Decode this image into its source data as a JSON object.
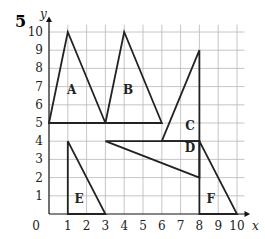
{
  "question_number": "5",
  "axes": {
    "x_label": "x",
    "y_label": "y",
    "x_ticks": [
      "1",
      "2",
      "3",
      "4",
      "5",
      "6",
      "7",
      "8",
      "9",
      "10"
    ],
    "y_ticks": [
      "1",
      "2",
      "3",
      "4",
      "5",
      "6",
      "7",
      "8",
      "9",
      "10"
    ],
    "origin_label": "0",
    "x_range": [
      0,
      10
    ],
    "y_range": [
      0,
      10
    ]
  },
  "shapes": [
    {
      "label": "A",
      "points": [
        [
          0,
          5
        ],
        [
          1,
          10
        ],
        [
          3,
          5
        ]
      ],
      "label_pos": [
        1.2,
        6.6
      ]
    },
    {
      "label": "B",
      "points": [
        [
          3,
          5
        ],
        [
          4,
          10
        ],
        [
          6,
          5
        ]
      ],
      "label_pos": [
        4.2,
        6.6
      ]
    },
    {
      "label": "C",
      "points": [
        [
          6,
          4
        ],
        [
          8,
          9
        ],
        [
          8,
          4
        ]
      ],
      "label_pos": [
        7.5,
        4.6
      ]
    },
    {
      "label": "D",
      "points": [
        [
          3,
          4
        ],
        [
          8,
          4
        ],
        [
          8,
          2
        ]
      ],
      "label_pos": [
        7.5,
        3.4
      ]
    },
    {
      "label": "E",
      "points": [
        [
          1,
          4
        ],
        [
          1,
          0
        ],
        [
          3,
          0
        ]
      ],
      "label_pos": [
        1.6,
        0.6
      ]
    },
    {
      "label": "F",
      "points": [
        [
          8,
          4
        ],
        [
          8,
          0
        ],
        [
          10,
          0
        ]
      ],
      "label_pos": [
        8.6,
        0.6
      ]
    }
  ],
  "colors": {
    "grid": "#b8b8b8",
    "line": "#222222",
    "axis": "#111111"
  }
}
